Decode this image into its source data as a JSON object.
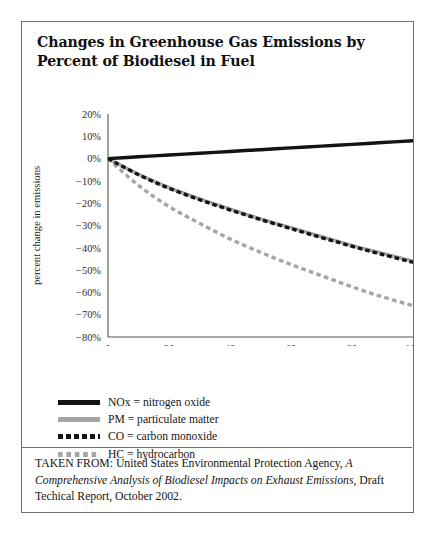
{
  "figure": {
    "title": "Changes in Greenhouse Gas Emissions by Percent of Biodiesel in Fuel",
    "caption": {
      "prefix": "TAKEN FROM: United States Environmental Protection Agency, ",
      "italic_title": "A Comprehensive Analysis of Biodiesel Impacts on Exhaust Emissions",
      "suffix": ", Draft Techical Report, October 2002."
    }
  },
  "legend": {
    "position": "below-plot",
    "items": [
      {
        "key": "nox",
        "label": "NOx = nitrogen oxide",
        "color": "#131313",
        "style": "solid"
      },
      {
        "key": "pm",
        "label": "PM = particulate matter",
        "color": "#a5a5a5",
        "style": "solid"
      },
      {
        "key": "co",
        "label": "CO = carbon monoxide",
        "color": "#131313",
        "style": "dashed"
      },
      {
        "key": "hc",
        "label": "HC = hydrocarbon",
        "color": "#a5a5a5",
        "style": "dashed"
      }
    ]
  },
  "chart_data": {
    "type": "line",
    "title": "Changes in Greenhouse Gas Emissions by Percent of Biodiesel in Fuel",
    "xlabel": "percent biodiesel",
    "ylabel": "percent change in emissions",
    "xlim": [
      0,
      100
    ],
    "ylim": [
      -80,
      20
    ],
    "xticks": [
      0,
      20,
      40,
      60,
      80,
      100
    ],
    "xtick_labels": [
      "0",
      "20",
      "40",
      "60",
      "80",
      "100"
    ],
    "yticks": [
      20,
      10,
      0,
      -10,
      -20,
      -30,
      -40,
      -50,
      -60,
      -70,
      -80
    ],
    "ytick_labels": [
      "20%",
      "10%",
      "0%",
      "−10%",
      "−20%",
      "−30%",
      "−40%",
      "−50%",
      "−60%",
      "−70%",
      "−80%"
    ],
    "grid": false,
    "x": [
      0,
      10,
      20,
      30,
      40,
      50,
      60,
      70,
      80,
      90,
      100
    ],
    "series": [
      {
        "name": "NOx = nitrogen oxide",
        "short": "NOx",
        "color": "#131313",
        "style": "solid",
        "values": [
          0,
          0.8,
          1.6,
          2.4,
          3.2,
          4.0,
          4.8,
          5.6,
          6.4,
          7.2,
          8.0
        ]
      },
      {
        "name": "PM = particulate matter",
        "short": "PM",
        "color": "#a5a5a5",
        "style": "solid",
        "values": [
          0,
          -7.0,
          -13.0,
          -18.0,
          -22.6,
          -27.0,
          -31.0,
          -35.0,
          -39.0,
          -42.5,
          -46.0
        ]
      },
      {
        "name": "CO = carbon monoxide",
        "short": "CO",
        "color": "#131313",
        "style": "dashed",
        "values": [
          0,
          -7.2,
          -13.3,
          -18.4,
          -23.0,
          -27.3,
          -31.4,
          -35.4,
          -39.3,
          -43.0,
          -46.5
        ]
      },
      {
        "name": "HC = hydrocarbon",
        "short": "HC",
        "color": "#a5a5a5",
        "style": "dashed",
        "values": [
          0,
          -12.0,
          -21.5,
          -29.0,
          -36.0,
          -42.0,
          -47.5,
          -52.5,
          -57.5,
          -62.0,
          -66.0
        ]
      }
    ]
  }
}
